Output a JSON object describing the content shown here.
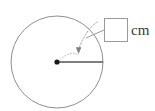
{
  "figure": {
    "kind": "circle-radius-diagram",
    "circle": {
      "center_x": 57,
      "center_y": 62,
      "radius": 46,
      "stroke_color": "#8f8f8f",
      "fill_color": "#ffffff"
    },
    "center_point": {
      "x": 57,
      "y": 62,
      "color": "#1a1a1a",
      "size": 5
    },
    "radius_segment": {
      "from_x": 57,
      "from_y": 62,
      "to_x": 103,
      "to_y": 62,
      "color": "#555555"
    },
    "annotation_arrow": {
      "style": "dotted-curved",
      "color": "#8a8a8a",
      "tip_x": 78,
      "tip_y": 53
    },
    "leader_line": {
      "from_x": 104,
      "from_y": 30,
      "to_x": 86,
      "to_y": 38,
      "color": "#8a8a8a"
    }
  },
  "answer": {
    "value": "",
    "placeholder": "",
    "unit_label": "cm"
  }
}
